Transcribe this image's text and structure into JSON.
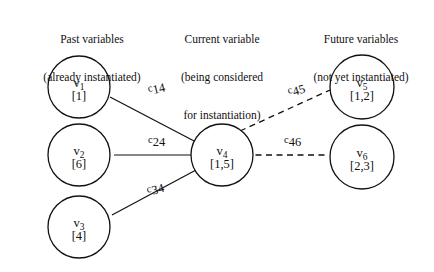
{
  "figure": {
    "background_color": "#ffffff",
    "ink_color": "#111111"
  },
  "headings": {
    "past": {
      "line1": "Past variables",
      "line2": "(already instantiated)"
    },
    "current": {
      "line1": "Current variable",
      "line2": "(being considered",
      "line3": "for instantiation)"
    },
    "future": {
      "line1": "Future variables",
      "line2": "(not yet instantiated)"
    }
  },
  "nodes": [
    {
      "id": "v1",
      "var_letter": "v",
      "var_index": "1",
      "domain": "[1]",
      "group": "past"
    },
    {
      "id": "v2",
      "var_letter": "v",
      "var_index": "2",
      "domain": "[6]",
      "group": "past"
    },
    {
      "id": "v3",
      "var_letter": "v",
      "var_index": "3",
      "domain": "[4]",
      "group": "past"
    },
    {
      "id": "v4",
      "var_letter": "v",
      "var_index": "4",
      "domain": "[1,5]",
      "group": "current"
    },
    {
      "id": "v5",
      "var_letter": "v",
      "var_index": "5",
      "domain": "[1,2]",
      "group": "future"
    },
    {
      "id": "v6",
      "var_letter": "v",
      "var_index": "6",
      "domain": "[2,3]",
      "group": "future"
    }
  ],
  "edges": [
    {
      "id": "c14",
      "label_main": "c",
      "label_sub": "14",
      "from": "v1",
      "to": "v4",
      "style": "solid"
    },
    {
      "id": "c24",
      "label_main": "c",
      "label_sub": "24",
      "from": "v2",
      "to": "v4",
      "style": "solid"
    },
    {
      "id": "c34",
      "label_main": "c",
      "label_sub": "34",
      "from": "v3",
      "to": "v4",
      "style": "solid"
    },
    {
      "id": "c45",
      "label_main": "c",
      "label_sub": "45",
      "from": "v4",
      "to": "v5",
      "style": "dashed"
    },
    {
      "id": "c46",
      "label_main": "c",
      "label_sub": "46",
      "from": "v4",
      "to": "v6",
      "style": "dashed"
    }
  ]
}
